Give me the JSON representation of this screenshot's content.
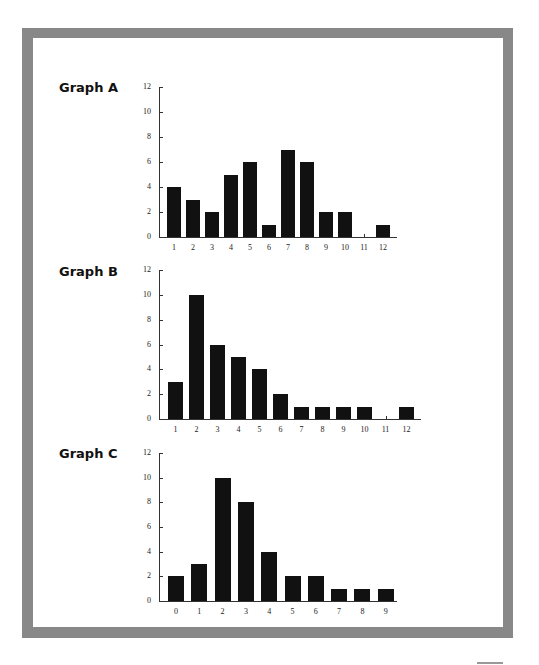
{
  "chart_data": [
    {
      "type": "bar",
      "title": "Graph A",
      "categories": [
        "1",
        "2",
        "3",
        "4",
        "5",
        "6",
        "7",
        "8",
        "9",
        "10",
        "11",
        "12"
      ],
      "values": [
        4,
        3,
        2,
        5,
        6,
        1,
        7,
        6,
        2,
        2,
        0,
        1
      ],
      "xlabel": "",
      "ylabel": "",
      "ylim": [
        0,
        12
      ],
      "yticks": [
        "0",
        "2",
        "4",
        "6",
        "8",
        "10",
        "12"
      ],
      "grid": false
    },
    {
      "type": "bar",
      "title": "Graph B",
      "categories": [
        "1",
        "2",
        "3",
        "4",
        "5",
        "6",
        "7",
        "8",
        "9",
        "10",
        "11",
        "12"
      ],
      "values": [
        3,
        10,
        6,
        5,
        4,
        2,
        1,
        1,
        1,
        1,
        0,
        1
      ],
      "xlabel": "",
      "ylabel": "",
      "ylim": [
        0,
        12
      ],
      "yticks": [
        "0",
        "2",
        "4",
        "6",
        "8",
        "10",
        "12"
      ],
      "grid": false
    },
    {
      "type": "bar",
      "title": "Graph C",
      "categories": [
        "0",
        "1",
        "2",
        "3",
        "4",
        "5",
        "6",
        "7",
        "8",
        "9"
      ],
      "values": [
        2,
        3,
        10,
        8,
        4,
        2,
        2,
        1,
        1,
        1
      ],
      "xlabel": "",
      "ylabel": "",
      "ylim": [
        0,
        12
      ],
      "yticks": [
        "0",
        "2",
        "4",
        "6",
        "8",
        "10",
        "12"
      ],
      "grid": false
    }
  ],
  "graphs": [
    {
      "title": "Graph A"
    },
    {
      "title": "Graph B"
    },
    {
      "title": "Graph C"
    }
  ],
  "colors": {
    "frame": "#888888",
    "bar": "#111111",
    "background": "#ffffff"
  }
}
